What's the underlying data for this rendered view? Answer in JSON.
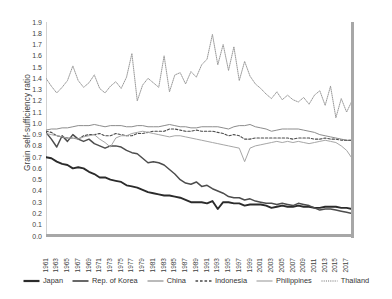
{
  "chart_data": {
    "type": "line",
    "title": "",
    "xlabel": "",
    "ylabel": "Grain self-sufficiency ratio",
    "ylim": [
      0.0,
      1.9
    ],
    "xlim": [
      1961,
      2018
    ],
    "grid": false,
    "legend_position": "bottom",
    "ytick_labels": [
      "1.9",
      "1.8",
      "1.7",
      "1.6",
      "1.5",
      "1.4",
      "1.3",
      "1.2",
      "1.1",
      "1.0",
      "0.9",
      "0.8",
      "0.7",
      "0.6",
      "0.5",
      "0.4",
      "0.3",
      "0.2",
      "0.1",
      "0.0"
    ],
    "xtick_labels": [
      "1961",
      "1963",
      "1965",
      "1967",
      "1969",
      "1971",
      "1973",
      "1975",
      "1977",
      "1979",
      "1981",
      "1983",
      "1985",
      "1987",
      "1989",
      "1991",
      "1993",
      "1995",
      "1997",
      "1999",
      "2001",
      "2003",
      "2005",
      "2007",
      "2009",
      "2011",
      "2013",
      "2015",
      "2017"
    ],
    "x": [
      1961,
      1962,
      1963,
      1964,
      1965,
      1966,
      1967,
      1968,
      1969,
      1970,
      1971,
      1972,
      1973,
      1974,
      1975,
      1976,
      1977,
      1978,
      1979,
      1980,
      1981,
      1982,
      1983,
      1984,
      1985,
      1986,
      1987,
      1988,
      1989,
      1990,
      1991,
      1992,
      1993,
      1994,
      1995,
      1996,
      1997,
      1998,
      1999,
      2000,
      2001,
      2002,
      2003,
      2004,
      2005,
      2006,
      2007,
      2008,
      2009,
      2010,
      2011,
      2012,
      2013,
      2014,
      2015,
      2016,
      2017,
      2018
    ],
    "series": [
      {
        "name": "Japan",
        "style": "solid",
        "color": "#2b2b2b",
        "width": 1.9,
        "values": [
          0.7,
          0.69,
          0.66,
          0.64,
          0.63,
          0.6,
          0.61,
          0.6,
          0.57,
          0.55,
          0.52,
          0.52,
          0.5,
          0.49,
          0.48,
          0.45,
          0.44,
          0.43,
          0.41,
          0.39,
          0.38,
          0.37,
          0.36,
          0.36,
          0.35,
          0.34,
          0.32,
          0.3,
          0.3,
          0.3,
          0.29,
          0.31,
          0.24,
          0.3,
          0.3,
          0.29,
          0.29,
          0.27,
          0.28,
          0.28,
          0.28,
          0.27,
          0.25,
          0.26,
          0.27,
          0.26,
          0.26,
          0.27,
          0.26,
          0.26,
          0.25,
          0.25,
          0.26,
          0.26,
          0.26,
          0.25,
          0.25,
          0.24
        ]
      },
      {
        "name": "Rep. of Korea",
        "style": "solid",
        "color": "#4d4d4d",
        "width": 1.5,
        "values": [
          0.92,
          0.86,
          0.79,
          0.89,
          0.84,
          0.9,
          0.86,
          0.84,
          0.86,
          0.82,
          0.8,
          0.78,
          0.8,
          0.8,
          0.79,
          0.76,
          0.74,
          0.73,
          0.69,
          0.65,
          0.66,
          0.65,
          0.63,
          0.59,
          0.55,
          0.5,
          0.47,
          0.46,
          0.48,
          0.44,
          0.45,
          0.42,
          0.4,
          0.38,
          0.35,
          0.34,
          0.34,
          0.32,
          0.33,
          0.31,
          0.3,
          0.29,
          0.29,
          0.28,
          0.29,
          0.28,
          0.27,
          0.29,
          0.28,
          0.27,
          0.25,
          0.23,
          0.24,
          0.24,
          0.23,
          0.22,
          0.21,
          0.2
        ]
      },
      {
        "name": "China",
        "style": "solid",
        "color": "#8c8c8c",
        "width": 1.0,
        "values": [
          0.94,
          0.95,
          0.95,
          0.96,
          0.96,
          0.97,
          0.98,
          0.98,
          0.98,
          0.99,
          0.98,
          0.97,
          0.98,
          0.98,
          0.98,
          0.97,
          0.97,
          0.98,
          0.98,
          0.97,
          0.97,
          0.97,
          0.98,
          0.99,
          0.98,
          0.97,
          0.97,
          0.96,
          0.96,
          0.97,
          0.97,
          0.97,
          0.97,
          0.96,
          0.95,
          0.97,
          0.98,
          0.98,
          0.99,
          0.97,
          0.96,
          0.95,
          0.93,
          0.94,
          0.95,
          0.95,
          0.95,
          0.95,
          0.94,
          0.93,
          0.92,
          0.9,
          0.89,
          0.88,
          0.87,
          0.86,
          0.85,
          0.85
        ]
      },
      {
        "name": "Indonesia",
        "style": "dashed",
        "color": "#4a4a4a",
        "width": 1.1,
        "values": [
          0.93,
          0.92,
          0.89,
          0.88,
          0.87,
          0.87,
          0.86,
          0.89,
          0.9,
          0.9,
          0.91,
          0.89,
          0.89,
          0.91,
          0.9,
          0.89,
          0.89,
          0.91,
          0.91,
          0.92,
          0.93,
          0.93,
          0.93,
          0.95,
          0.95,
          0.94,
          0.93,
          0.93,
          0.94,
          0.93,
          0.93,
          0.93,
          0.92,
          0.91,
          0.89,
          0.9,
          0.89,
          0.86,
          0.86,
          0.87,
          0.87,
          0.87,
          0.87,
          0.87,
          0.87,
          0.87,
          0.86,
          0.87,
          0.87,
          0.87,
          0.86,
          0.86,
          0.87,
          0.86,
          0.86,
          0.85,
          0.85,
          0.85
        ]
      },
      {
        "name": "Philippines",
        "style": "solid",
        "color": "#a6a6a6",
        "width": 1.0,
        "values": [
          0.91,
          0.9,
          0.89,
          0.88,
          0.87,
          0.87,
          0.86,
          0.88,
          0.89,
          0.9,
          0.86,
          0.83,
          0.79,
          0.87,
          0.89,
          0.89,
          0.91,
          0.92,
          0.93,
          0.92,
          0.91,
          0.9,
          0.89,
          0.88,
          0.89,
          0.89,
          0.88,
          0.87,
          0.86,
          0.85,
          0.84,
          0.83,
          0.82,
          0.81,
          0.8,
          0.79,
          0.78,
          0.66,
          0.78,
          0.8,
          0.81,
          0.82,
          0.83,
          0.84,
          0.83,
          0.84,
          0.83,
          0.84,
          0.83,
          0.82,
          0.83,
          0.84,
          0.85,
          0.84,
          0.83,
          0.8,
          0.76,
          0.69
        ]
      },
      {
        "name": "Thailand",
        "style": "dotted",
        "color": "#9a9a9a",
        "width": 1.0,
        "values": [
          1.4,
          1.33,
          1.27,
          1.32,
          1.38,
          1.51,
          1.38,
          1.32,
          1.36,
          1.43,
          1.31,
          1.27,
          1.33,
          1.37,
          1.31,
          1.41,
          1.62,
          1.2,
          1.34,
          1.4,
          1.36,
          1.32,
          1.6,
          1.28,
          1.43,
          1.45,
          1.35,
          1.46,
          1.41,
          1.52,
          1.57,
          1.79,
          1.52,
          1.7,
          1.47,
          1.68,
          1.38,
          1.55,
          1.42,
          1.35,
          1.31,
          1.26,
          1.22,
          1.28,
          1.21,
          1.25,
          1.21,
          1.19,
          1.23,
          1.17,
          1.25,
          1.29,
          1.16,
          1.33,
          1.05,
          1.22,
          1.1,
          1.2
        ]
      }
    ]
  },
  "legend": {
    "items": [
      {
        "label": "Japan",
        "style": "solid",
        "color": "#2b2b2b",
        "width": 2.2
      },
      {
        "label": "Rep. of Korea",
        "style": "solid",
        "color": "#4d4d4d",
        "width": 1.7
      },
      {
        "label": "China",
        "style": "solid",
        "color": "#8c8c8c",
        "width": 1.2
      },
      {
        "label": "Indonesia",
        "style": "dashed",
        "color": "#4a4a4a",
        "width": 1.3
      },
      {
        "label": "Philippines",
        "style": "solid",
        "color": "#a6a6a6",
        "width": 1.2
      },
      {
        "label": "Thailand",
        "style": "dotted",
        "color": "#9a9a9a",
        "width": 1.3
      }
    ]
  }
}
